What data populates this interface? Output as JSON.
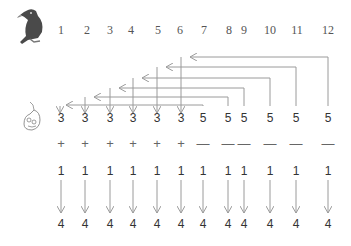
{
  "top_row": {
    "icon": "eagle-icon",
    "labels": [
      "1",
      "2",
      "3",
      "4",
      "5",
      "6",
      "7",
      "8",
      "9",
      "10",
      "11",
      "12"
    ]
  },
  "values_row": {
    "icon": "mouse-icon",
    "values": [
      "3",
      "3",
      "3",
      "3",
      "3",
      "3",
      "5",
      "5",
      "5",
      "5",
      "5",
      "5"
    ]
  },
  "signs_row": {
    "values": [
      "+",
      "+",
      "+",
      "+",
      "+",
      "+",
      "—",
      "—",
      "—",
      "—",
      "—",
      "—"
    ]
  },
  "ones_row": {
    "values": [
      "1",
      "1",
      "1",
      "1",
      "1",
      "1",
      "1",
      "1",
      "1",
      "1",
      "1",
      "1"
    ]
  },
  "result_row": {
    "values": [
      "4",
      "4",
      "4",
      "4",
      "4",
      "4",
      "4",
      "4",
      "4",
      "4",
      "4",
      "4"
    ]
  },
  "connections": [
    {
      "from": "12",
      "to": "6"
    },
    {
      "from": "11",
      "to": "5"
    },
    {
      "from": "10",
      "to": "4"
    },
    {
      "from": "9",
      "to": "3"
    },
    {
      "from": "8",
      "to": "2"
    },
    {
      "from": "7",
      "to": "1"
    }
  ],
  "colors": {
    "arrow": "#9a9a9a",
    "text": "#333333"
  }
}
